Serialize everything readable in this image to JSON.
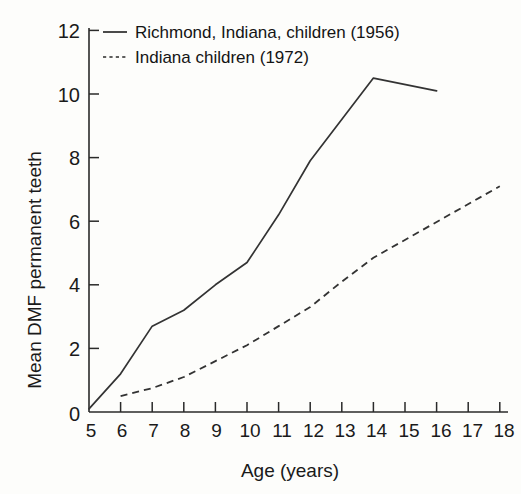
{
  "chart_data": {
    "type": "line",
    "title": "",
    "xlabel": "Age (years)",
    "ylabel": "Mean DMF permanent teeth",
    "xlim": [
      5,
      18
    ],
    "ylim": [
      0,
      12
    ],
    "xticks": [
      5,
      6,
      7,
      8,
      9,
      10,
      11,
      12,
      13,
      14,
      15,
      16,
      17,
      18
    ],
    "xticklabels": [
      "5",
      "6",
      "7",
      "8",
      "9",
      "10",
      "11",
      "12",
      "13",
      "14",
      "15",
      "16",
      "17",
      "18"
    ],
    "yticks": [
      0,
      2,
      4,
      6,
      8,
      10,
      12
    ],
    "yticklabels": [
      "0",
      "2",
      "4",
      "6",
      "8",
      "10",
      "12"
    ],
    "grid": false,
    "legend_position": "top-left",
    "series": [
      {
        "name": "Richmond, Indiana, children (1956)",
        "style": "solid",
        "color": "#333333",
        "x": [
          5,
          6,
          7,
          8,
          9,
          10,
          11,
          12,
          14,
          16
        ],
        "values": [
          0.1,
          1.2,
          2.7,
          3.2,
          4.0,
          4.7,
          6.2,
          7.9,
          10.5,
          10.1
        ]
      },
      {
        "name": "Indiana children (1972)",
        "style": "dashed",
        "color": "#333333",
        "x": [
          6,
          7,
          8,
          9,
          10,
          11,
          12,
          13,
          14,
          18
        ],
        "values": [
          0.5,
          0.75,
          1.1,
          1.6,
          2.1,
          2.7,
          3.3,
          4.1,
          4.85,
          7.1
        ]
      }
    ]
  },
  "legend": {
    "entries": [
      {
        "label": "Richmond, Indiana, children (1956)",
        "style": "solid"
      },
      {
        "label": "Indiana children (1972)",
        "style": "dashed"
      }
    ]
  },
  "axes": {
    "x_title": "Age (years)",
    "y_title": "Mean DMF permanent teeth"
  }
}
